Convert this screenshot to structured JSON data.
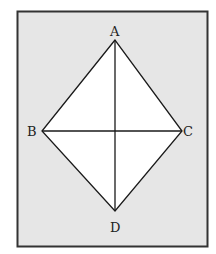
{
  "diagram": {
    "type": "rhombus-with-diagonals",
    "frame": {
      "fill": "#e6e6e6",
      "stroke": "#333333"
    },
    "shape": {
      "fill": "#ffffff",
      "stroke": "#1a1a1a"
    },
    "vertices": {
      "A": {
        "label": "A",
        "x": 115,
        "y": 40
      },
      "B": {
        "label": "B",
        "x": 42,
        "y": 131
      },
      "C": {
        "label": "C",
        "x": 182,
        "y": 131
      },
      "D": {
        "label": "D",
        "x": 115,
        "y": 211
      }
    },
    "edges": [
      "AB",
      "BD",
      "DC",
      "CA"
    ],
    "diagonals": [
      "AD",
      "BC"
    ]
  }
}
